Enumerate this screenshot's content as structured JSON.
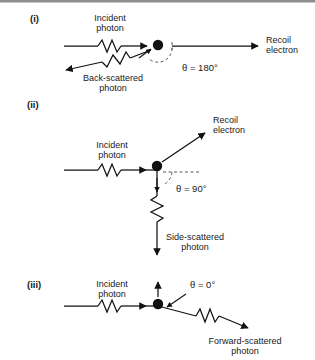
{
  "figure": {
    "background_color": "#ffffff",
    "line_color": "#111111",
    "dashed_color": "#5a5a5a"
  },
  "panels": [
    {
      "id": "panel-i",
      "label": "(i)",
      "angle_label": "θ = 180°",
      "angle_value": 180,
      "incident_label_line1": "Incident",
      "incident_label_line2": "photon",
      "scattered_label_line1": "Back-scattered",
      "scattered_label_line2": "photon",
      "electron_label_line1": "Recoil",
      "electron_label_line2": "electron"
    },
    {
      "id": "panel-ii",
      "label": "(ii)",
      "angle_label": "θ = 90°",
      "angle_value": 90,
      "incident_label_line1": "Incident",
      "incident_label_line2": "photon",
      "scattered_label_line1": "Side-scattered",
      "scattered_label_line2": "photon",
      "electron_label_line1": "Recoil",
      "electron_label_line2": "electron"
    },
    {
      "id": "panel-iii",
      "label": "(iii)",
      "angle_label": "θ = 0°",
      "angle_value": 0,
      "incident_label_line1": "Incident",
      "incident_label_line2": "photon",
      "scattered_label_line1": "Forward-scattered",
      "scattered_label_line2": "photon",
      "electron_label_line1": "",
      "electron_label_line2": ""
    }
  ],
  "symbols": {
    "theta": "θ",
    "degree": "°"
  }
}
